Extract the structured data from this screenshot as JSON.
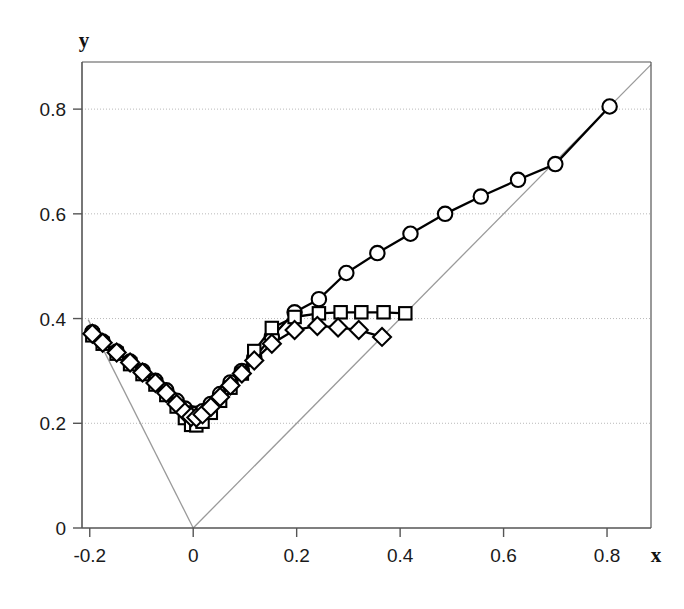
{
  "chart_data": {
    "type": "line",
    "title": "",
    "subtitle": "",
    "xlabel": "x",
    "ylabel": "y",
    "xlim": [
      -0.215,
      0.885
    ],
    "ylim": [
      0.0,
      0.89
    ],
    "xticks": [
      -0.2,
      0,
      0.2,
      0.4,
      0.6,
      0.8
    ],
    "xtick_labels": [
      "-0.2",
      "0",
      "0.2",
      "0.4",
      "0.6",
      "0.8"
    ],
    "yticks": [
      0,
      0.2,
      0.4,
      0.6,
      0.8
    ],
    "ytick_labels": [
      "0",
      "0.2",
      "0.4",
      "0.6",
      "0.8"
    ],
    "grid": "horizontal-dotted",
    "gridlines_y": [
      0.2,
      0.4,
      0.6,
      0.8
    ],
    "legend": "none",
    "colors": {
      "series": "#000000",
      "reference_line": "#9a9a9a",
      "axis": "#555555",
      "grid": "#b9b9b9",
      "background": "#ffffff"
    },
    "series": [
      {
        "name": "circles",
        "marker": "circle",
        "x": [
          -0.195,
          -0.175,
          -0.148,
          -0.122,
          -0.098,
          -0.073,
          -0.052,
          -0.032,
          -0.016,
          -0.004,
          0.006,
          0.018,
          0.034,
          0.052,
          0.072,
          0.094,
          0.118,
          0.152,
          0.196,
          0.243,
          0.296,
          0.356,
          0.42,
          0.487,
          0.556,
          0.628,
          0.7,
          0.805
        ],
        "y": [
          0.374,
          0.356,
          0.337,
          0.318,
          0.3,
          0.281,
          0.263,
          0.243,
          0.228,
          0.219,
          0.218,
          0.223,
          0.237,
          0.256,
          0.278,
          0.3,
          0.325,
          0.365,
          0.412,
          0.437,
          0.487,
          0.525,
          0.562,
          0.6,
          0.633,
          0.665,
          0.695,
          0.805
        ]
      },
      {
        "name": "squares",
        "marker": "square",
        "x": [
          -0.195,
          -0.175,
          -0.148,
          -0.122,
          -0.098,
          -0.073,
          -0.052,
          -0.032,
          -0.016,
          -0.004,
          0.006,
          0.018,
          0.034,
          0.052,
          0.072,
          0.094,
          0.118,
          0.152,
          0.196,
          0.243,
          0.285,
          0.325,
          0.368,
          0.41
        ],
        "y": [
          0.368,
          0.352,
          0.333,
          0.313,
          0.294,
          0.274,
          0.254,
          0.232,
          0.21,
          0.197,
          0.196,
          0.203,
          0.22,
          0.243,
          0.268,
          0.295,
          0.338,
          0.382,
          0.403,
          0.41,
          0.412,
          0.412,
          0.412,
          0.41
        ]
      },
      {
        "name": "diamonds",
        "marker": "diamond",
        "x": [
          -0.195,
          -0.175,
          -0.148,
          -0.122,
          -0.098,
          -0.073,
          -0.052,
          -0.032,
          -0.016,
          -0.004,
          0.006,
          0.018,
          0.034,
          0.052,
          0.072,
          0.094,
          0.118,
          0.152,
          0.196,
          0.24,
          0.28,
          0.32,
          0.365
        ],
        "y": [
          0.371,
          0.354,
          0.335,
          0.316,
          0.297,
          0.277,
          0.258,
          0.237,
          0.221,
          0.212,
          0.211,
          0.217,
          0.231,
          0.25,
          0.272,
          0.295,
          0.32,
          0.352,
          0.378,
          0.386,
          0.383,
          0.378,
          0.365
        ]
      }
    ],
    "reference_lines": [
      {
        "name": "left-ray",
        "points": [
          [
            -0.203,
            0.398
          ],
          [
            0.0,
            0.0
          ]
        ]
      },
      {
        "name": "right-ray",
        "points": [
          [
            0.0,
            0.0
          ],
          [
            0.885,
            0.885
          ]
        ]
      }
    ],
    "annotations": []
  }
}
